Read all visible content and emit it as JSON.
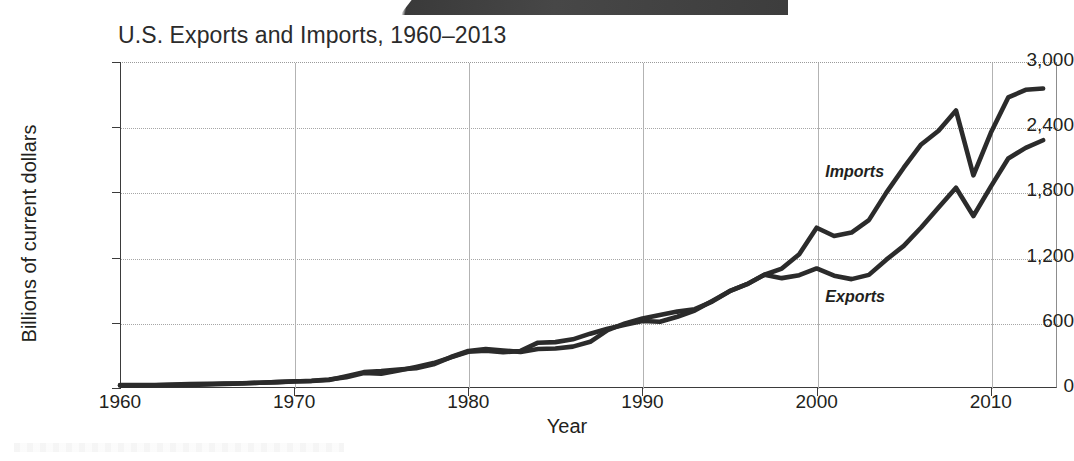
{
  "chart_data": {
    "type": "line",
    "title": "U.S. Exports and Imports, 1960–2013",
    "xlabel": "Year",
    "ylabel": "Billions of current dollars",
    "xlim": [
      1960,
      2013.8
    ],
    "ylim": [
      0,
      3000
    ],
    "grid": true,
    "legend_position": "inline-annotation",
    "y_ticks": [
      0,
      600,
      1200,
      1800,
      2400,
      3000
    ],
    "y_tick_labels": [
      "0",
      "600",
      "1,200",
      "1,800",
      "2,400",
      "3,000"
    ],
    "x_ticks": [
      1960,
      1970,
      1980,
      1990,
      2000,
      2010
    ],
    "x_tick_labels": [
      "1960",
      "1970",
      "1980",
      "1990",
      "2000",
      "2010"
    ],
    "x": [
      1960,
      1961,
      1962,
      1963,
      1964,
      1965,
      1966,
      1967,
      1968,
      1969,
      1970,
      1971,
      1972,
      1973,
      1974,
      1975,
      1976,
      1977,
      1978,
      1979,
      1980,
      1981,
      1982,
      1983,
      1984,
      1985,
      1986,
      1987,
      1988,
      1989,
      1990,
      1991,
      1992,
      1993,
      1994,
      1995,
      1996,
      1997,
      1998,
      1999,
      2000,
      2001,
      2002,
      2003,
      2004,
      2005,
      2006,
      2007,
      2008,
      2009,
      2010,
      2011,
      2012,
      2013
    ],
    "series": [
      {
        "name": "Imports",
        "color": "#2b2b2b",
        "values": [
          23,
          23,
          25,
          26,
          29,
          32,
          38,
          41,
          49,
          54,
          60,
          66,
          79,
          99,
          138,
          132,
          162,
          194,
          229,
          282,
          334,
          343,
          329,
          341,
          417,
          422,
          448,
          500,
          546,
          581,
          616,
          610,
          656,
          713,
          801,
          891,
          955,
          1042,
          1099,
          1231,
          1475,
          1399,
          1430,
          1545,
          1798,
          2027,
          2241,
          2368,
          2554,
          1957,
          2348,
          2674,
          2744,
          2756
        ]
      },
      {
        "name": "Exports",
        "color": "#2b2b2b",
        "values": [
          26,
          27,
          28,
          31,
          36,
          38,
          42,
          44,
          49,
          54,
          62,
          65,
          73,
          108,
          146,
          156,
          170,
          182,
          218,
          285,
          340,
          359,
          345,
          331,
          359,
          364,
          381,
          425,
          532,
          594,
          639,
          671,
          703,
          725,
          795,
          891,
          955,
          1042,
          1011,
          1038,
          1100,
          1034,
          1002,
          1041,
          1181,
          1308,
          1477,
          1661,
          1843,
          1583,
          1853,
          2112,
          2210,
          2280
        ]
      }
    ],
    "annotations": [
      {
        "text": "Imports",
        "x": 2000.5,
        "y": 1980
      },
      {
        "text": "Exports",
        "x": 2000.5,
        "y": 830
      }
    ]
  }
}
